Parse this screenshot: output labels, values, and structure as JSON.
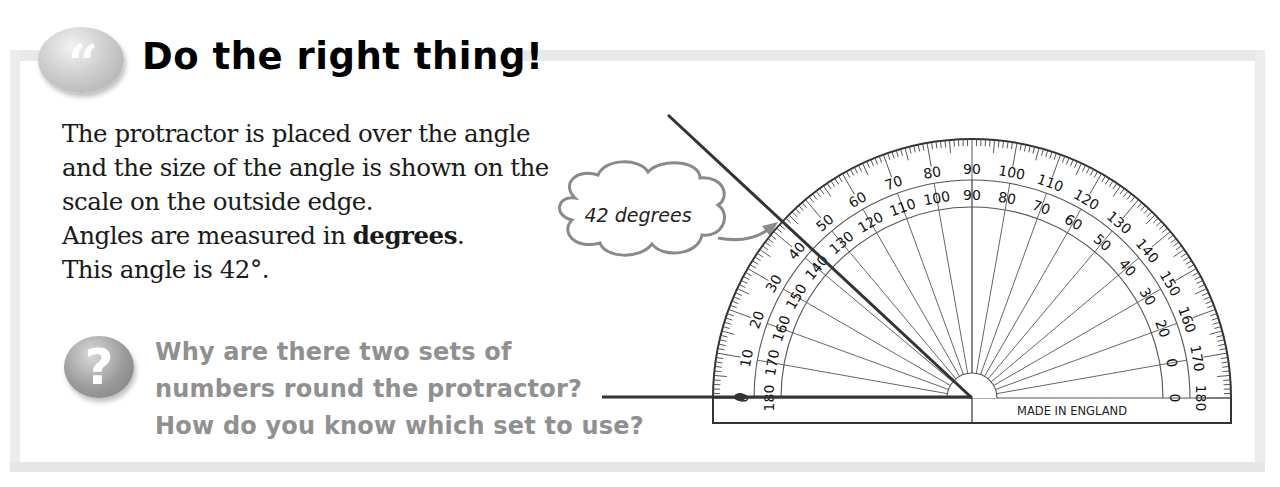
{
  "header": {
    "icon": "quote-icon",
    "icon_glyph": "“",
    "title": "Do the right thing!"
  },
  "body": {
    "lines": [
      {
        "text": "The protractor is placed over the angle"
      },
      {
        "text": "and the size of the angle is shown on the"
      },
      {
        "text": "scale on the outside edge."
      },
      {
        "pre": "Angles are measured in ",
        "bold": "degrees",
        "post": "."
      },
      {
        "text": "This angle is 42°."
      }
    ]
  },
  "question": {
    "icon": "question-icon",
    "icon_glyph": "?",
    "lines": [
      "Why are there two sets of",
      "numbers round the protractor?",
      "How do you know which set to use?"
    ],
    "color": "#909090"
  },
  "callout": {
    "label": "42 degrees",
    "stroke": "#8a8a8a"
  },
  "protractor": {
    "center": [
      972,
      398
    ],
    "outer_radius": 259,
    "outer_scale_labels": [
      "0",
      "10",
      "20",
      "30",
      "40",
      "50",
      "60",
      "70",
      "80",
      "90",
      "100",
      "110",
      "120",
      "130",
      "140",
      "150",
      "160",
      "170",
      "180"
    ],
    "inner_scale_labels": [
      "180",
      "170",
      "160",
      "150",
      "140",
      "130",
      "120",
      "110",
      "100",
      "90",
      "80",
      "70",
      "60",
      "50",
      "40",
      "30",
      "20",
      "0",
      "0"
    ],
    "imprint": "MADE IN ENGLAND",
    "measured_angle_deg": 42,
    "line_color": "#333333"
  },
  "colors": {
    "frame": "#e9e9e9",
    "title": "#000000",
    "body_text": "#1a1a1a"
  }
}
